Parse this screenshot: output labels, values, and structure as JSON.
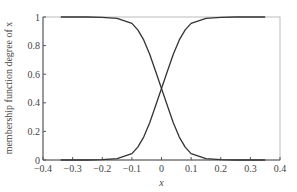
{
  "chart_data": {
    "type": "line",
    "title": "",
    "xlabel": "x",
    "ylabel": "membership function degree of x",
    "xlim": [
      -0.4,
      0.4
    ],
    "ylim": [
      0,
      1
    ],
    "grid": false,
    "legend": null,
    "xticks": [
      -0.4,
      -0.3,
      -0.2,
      -0.1,
      0,
      0.1,
      0.2,
      0.3,
      0.4
    ],
    "xtick_labels": [
      "−0.4",
      "−0.3",
      "−0.2",
      "−0.1",
      "0",
      "0.1",
      "0.2",
      "0.3",
      "0.4"
    ],
    "yticks": [
      0,
      0.2,
      0.4,
      0.6,
      0.8,
      1
    ],
    "ytick_labels": [
      "0",
      "0.2",
      "0.4",
      "0.6",
      "0.8",
      "1"
    ],
    "series": [
      {
        "name": "decreasing sigmoid",
        "color": "#333333",
        "x": [
          -0.34,
          -0.3,
          -0.25,
          -0.2,
          -0.15,
          -0.1,
          -0.08,
          -0.06,
          -0.04,
          -0.02,
          0,
          0.02,
          0.04,
          0.06,
          0.08,
          0.1,
          0.15,
          0.2,
          0.25,
          0.3,
          0.35
        ],
        "y": [
          1.0,
          1.0,
          1.0,
          0.998,
          0.99,
          0.955,
          0.91,
          0.84,
          0.74,
          0.62,
          0.5,
          0.38,
          0.26,
          0.16,
          0.09,
          0.045,
          0.01,
          0.002,
          0.0,
          0.0,
          0.0
        ]
      },
      {
        "name": "increasing sigmoid",
        "color": "#333333",
        "x": [
          -0.34,
          -0.3,
          -0.25,
          -0.2,
          -0.15,
          -0.1,
          -0.08,
          -0.06,
          -0.04,
          -0.02,
          0,
          0.02,
          0.04,
          0.06,
          0.08,
          0.1,
          0.15,
          0.2,
          0.25,
          0.3,
          0.35
        ],
        "y": [
          0.0,
          0.0,
          0.0,
          0.002,
          0.01,
          0.045,
          0.09,
          0.16,
          0.26,
          0.38,
          0.5,
          0.62,
          0.74,
          0.84,
          0.91,
          0.955,
          0.99,
          0.998,
          1.0,
          1.0,
          1.0
        ]
      }
    ]
  }
}
